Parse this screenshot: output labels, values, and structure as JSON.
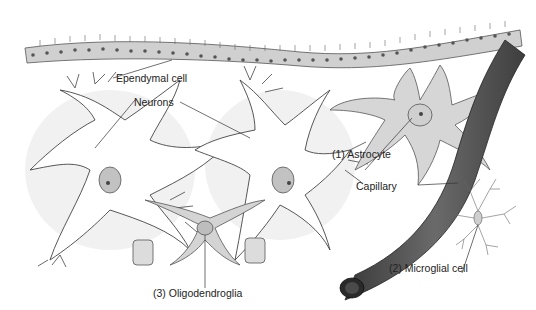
{
  "figure": {
    "type": "anatomical-illustration",
    "colors": {
      "background": "#ffffff",
      "cell_fill": "#d4d4d4",
      "cell_stroke": "#444444",
      "neuron_halo": "#efefef",
      "capillary": "#5a5a5a",
      "capillary_dark": "#333333",
      "nucleus": "#b8b8b8",
      "label_text": "#222222"
    }
  },
  "labels": {
    "ependymal": "Ependymal cell",
    "neurons": "Neurons",
    "astrocyte": "(1) Astrocyte",
    "capillary": "Capillary",
    "microglial": "(2) Microglial cell",
    "oligodendroglia": "(3) Oligodendroglia"
  }
}
